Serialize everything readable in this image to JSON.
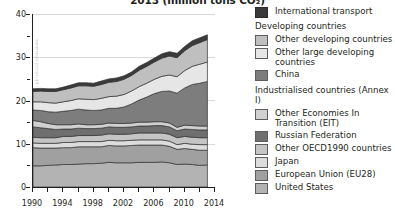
{
  "title": {
    "text": "2013 (million tons CO₂)",
    "note_clipped_top": true
  },
  "chart_data": {
    "type": "area",
    "title": "2013 (million tons CO₂)",
    "xlabel": "",
    "ylabel": "",
    "xlim": [
      1990,
      2014
    ],
    "ylim": [
      0,
      40
    ],
    "xticks": [
      "1990",
      "1994",
      "1998",
      "2002",
      "2006",
      "2010",
      "2014"
    ],
    "yticks": [
      "0",
      "10",
      "20",
      "30",
      "40"
    ],
    "yminorticks": [
      5,
      15,
      25,
      35
    ],
    "grid": "horizontal-light",
    "legend_position": "right",
    "stacked": true,
    "x": [
      1990,
      1991,
      1992,
      1993,
      1994,
      1995,
      1996,
      1997,
      1998,
      1999,
      2000,
      2001,
      2002,
      2003,
      2004,
      2005,
      2006,
      2007,
      2008,
      2009,
      2010,
      2011,
      2012,
      2013
    ],
    "series": [
      {
        "name": "United States",
        "color": "#b3b3b3",
        "values": [
          4.9,
          4.9,
          5.0,
          5.1,
          5.2,
          5.2,
          5.3,
          5.4,
          5.4,
          5.5,
          5.7,
          5.6,
          5.6,
          5.6,
          5.7,
          5.7,
          5.7,
          5.8,
          5.6,
          5.2,
          5.3,
          5.2,
          5.0,
          5.1
        ]
      },
      {
        "name": "European Union (EU28)",
        "color": "#a0a0a0",
        "values": [
          4.2,
          4.1,
          4.0,
          3.9,
          3.9,
          3.9,
          4.0,
          3.9,
          3.9,
          3.8,
          3.9,
          3.9,
          3.9,
          4.0,
          4.0,
          4.0,
          4.0,
          3.9,
          3.8,
          3.5,
          3.6,
          3.5,
          3.5,
          3.4
        ]
      },
      {
        "name": "Japan",
        "color": "#dcdcdc",
        "values": [
          1.1,
          1.1,
          1.1,
          1.1,
          1.2,
          1.2,
          1.2,
          1.2,
          1.2,
          1.2,
          1.2,
          1.2,
          1.2,
          1.2,
          1.2,
          1.2,
          1.2,
          1.2,
          1.2,
          1.1,
          1.2,
          1.2,
          1.3,
          1.3
        ]
      },
      {
        "name": "Other OECD1990 countries",
        "color": "#c4c4c4",
        "values": [
          1.3,
          1.3,
          1.3,
          1.3,
          1.4,
          1.4,
          1.4,
          1.4,
          1.4,
          1.5,
          1.5,
          1.5,
          1.5,
          1.5,
          1.6,
          1.6,
          1.6,
          1.6,
          1.6,
          1.6,
          1.6,
          1.6,
          1.6,
          1.6
        ]
      },
      {
        "name": "Russian Federation",
        "color": "#6f6f6f",
        "values": [
          2.4,
          2.3,
          2.1,
          1.9,
          1.7,
          1.7,
          1.7,
          1.6,
          1.6,
          1.6,
          1.6,
          1.6,
          1.6,
          1.6,
          1.6,
          1.6,
          1.7,
          1.7,
          1.7,
          1.6,
          1.7,
          1.8,
          1.8,
          1.8
        ]
      },
      {
        "name": "Other Economies In Transition (EIT)",
        "color": "#d0d0d0",
        "values": [
          1.5,
          1.4,
          1.2,
          1.1,
          1.0,
          1.0,
          1.0,
          0.9,
          0.9,
          0.9,
          0.9,
          0.9,
          0.9,
          0.9,
          0.9,
          0.9,
          0.9,
          0.9,
          0.9,
          0.8,
          0.9,
          0.9,
          0.9,
          0.9
        ]
      },
      {
        "name": "China",
        "color": "#7d7d7d",
        "values": [
          2.4,
          2.6,
          2.7,
          2.9,
          3.1,
          3.3,
          3.4,
          3.4,
          3.3,
          3.3,
          3.4,
          3.5,
          3.8,
          4.4,
          5.1,
          5.8,
          6.5,
          7.0,
          7.4,
          7.9,
          8.6,
          9.5,
          9.9,
          10.3
        ]
      },
      {
        "name": "Other large developing countries",
        "color": "#e6e6e6",
        "values": [
          1.9,
          2.0,
          2.1,
          2.1,
          2.2,
          2.3,
          2.4,
          2.5,
          2.5,
          2.7,
          2.7,
          2.8,
          2.9,
          3.0,
          3.1,
          3.2,
          3.3,
          3.5,
          3.7,
          3.8,
          4.0,
          4.2,
          4.4,
          4.5
        ]
      },
      {
        "name": "Other developing countries",
        "color": "#bfbfbf",
        "values": [
          2.4,
          2.5,
          2.6,
          2.7,
          2.8,
          2.9,
          3.0,
          3.1,
          3.1,
          3.2,
          3.3,
          3.4,
          3.5,
          3.6,
          3.8,
          3.9,
          4.0,
          4.2,
          4.4,
          4.4,
          4.6,
          4.8,
          5.0,
          5.2
        ]
      },
      {
        "name": "International transport",
        "color": "#3a3a3a",
        "values": [
          0.6,
          0.6,
          0.6,
          0.6,
          0.6,
          0.7,
          0.7,
          0.7,
          0.7,
          0.8,
          0.8,
          0.8,
          0.8,
          0.8,
          0.9,
          0.9,
          0.9,
          1.0,
          1.0,
          1.0,
          1.0,
          1.1,
          1.1,
          1.1
        ]
      }
    ],
    "totals": [
      22.7,
      22.8,
      22.7,
      22.7,
      23.1,
      23.6,
      24.1,
      24.1,
      24.0,
      24.5,
      25.0,
      25.2,
      25.7,
      26.6,
      27.9,
      28.8,
      29.8,
      30.8,
      31.3,
      30.9,
      32.5,
      33.8,
      34.5,
      35.2
    ]
  },
  "legend": {
    "items": [
      {
        "label": "International transport",
        "color": "#3a3a3a",
        "type": "swatch"
      },
      {
        "label": "Developing countries",
        "type": "header"
      },
      {
        "label": "Other developing countries",
        "color": "#bfbfbf",
        "type": "swatch"
      },
      {
        "label": "Other large developing countries",
        "color": "#e6e6e6",
        "type": "swatch"
      },
      {
        "label": "China",
        "color": "#7d7d7d",
        "type": "swatch"
      },
      {
        "label": "Industrialised countries (Annex I)",
        "type": "header"
      },
      {
        "label": "Other Economies In Transition (EIT)",
        "color": "#d0d0d0",
        "type": "swatch"
      },
      {
        "label": "Russian Federation",
        "color": "#6f6f6f",
        "type": "swatch"
      },
      {
        "label": "Other OECD1990 countries",
        "color": "#c4c4c4",
        "type": "swatch"
      },
      {
        "label": "Japan",
        "color": "#dcdcdc",
        "type": "swatch"
      },
      {
        "label": "European Union (EU28)",
        "color": "#a0a0a0",
        "type": "swatch"
      },
      {
        "label": "United States",
        "color": "#b3b3b3",
        "type": "swatch"
      }
    ],
    "l0": "International transport",
    "h1": "Developing countries",
    "l2": "Other developing countries",
    "l3a": "Other large developing",
    "l3b": "countries",
    "l4": "China",
    "h2": "Industrialised countries (Annex I)",
    "l5a": "Other Economies In",
    "l5b": "Transition (EIT)",
    "l6": "Russian Federation",
    "l7": "Other OECD1990 countries",
    "l8": "Japan",
    "l9": "European Union (EU28)",
    "l10": "United States"
  },
  "watermark": {
    "text": "pbl.nl/co2-emissions"
  }
}
